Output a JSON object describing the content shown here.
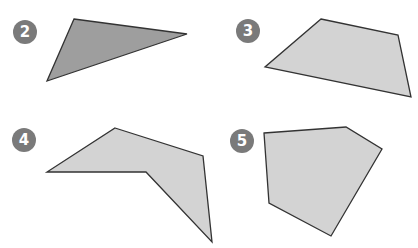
{
  "colors": {
    "badge_bg": "#7a7a7a",
    "badge_text": "#ffffff",
    "shape_dark_fill": "#9e9e9e",
    "shape_light_fill": "#d3d3d3",
    "stroke": "#333333"
  },
  "figures": [
    {
      "label": "2",
      "badge_center": [
        25,
        32
      ],
      "shape": "triangle",
      "fill": "dark",
      "points": [
        [
          74,
          19
        ],
        [
          187,
          34
        ],
        [
          47,
          81
        ]
      ]
    },
    {
      "label": "3",
      "badge_center": [
        248,
        31
      ],
      "shape": "quadrilateral",
      "fill": "light",
      "points": [
        [
          321,
          19
        ],
        [
          398,
          35
        ],
        [
          411,
          97
        ],
        [
          265,
          67
        ]
      ]
    },
    {
      "label": "4",
      "badge_center": [
        24,
        140
      ],
      "shape": "concave-pentagon",
      "fill": "light",
      "points": [
        [
          115,
          128
        ],
        [
          203,
          156
        ],
        [
          212,
          242
        ],
        [
          146,
          172
        ],
        [
          47,
          172
        ]
      ]
    },
    {
      "label": "5",
      "badge_center": [
        242,
        141
      ],
      "shape": "pentagon",
      "fill": "light",
      "points": [
        [
          264,
          133
        ],
        [
          346,
          127
        ],
        [
          382,
          149
        ],
        [
          331,
          236
        ],
        [
          269,
          203
        ]
      ]
    }
  ]
}
